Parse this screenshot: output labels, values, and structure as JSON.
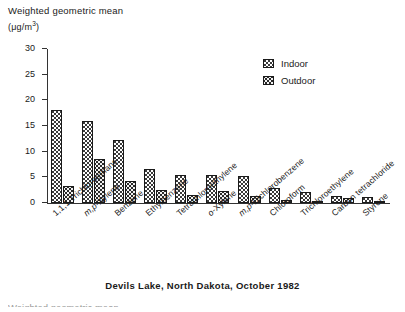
{
  "chart_data": {
    "type": "bar",
    "title": "",
    "caption": "Devils Lake, North Dakota, October 1982",
    "ylabel_line1": "Weighted geometric mean",
    "ylabel_line2": "(μg/m3)",
    "ylabel_unit_prefix": "(",
    "ylabel_unit_base": "μg/m",
    "ylabel_unit_sup": "3",
    "ylabel_unit_suffix": ")",
    "xlabel": "",
    "ylim": [
      0,
      30
    ],
    "yticks": [
      0,
      5,
      10,
      15,
      20,
      25,
      30
    ],
    "ytick_labels": [
      "0",
      "5",
      "10",
      "15",
      "20",
      "25",
      "30"
    ],
    "grid": false,
    "legend_position": "top-right",
    "categories": [
      "1,1,1 Trichloroethane",
      "m,p-Xylene",
      "Benzene",
      "Ethylbenzene",
      "Tetrachloroethylene",
      "o-Xylene",
      "m,p-Dichlorobenzene",
      "Chloroform",
      "Trichloroethylene",
      "Carbon tetrachloride",
      "Styrene"
    ],
    "series": [
      {
        "name": "Indoor",
        "values": [
          18.2,
          15.9,
          12.2,
          6.6,
          5.5,
          5.4,
          5.2,
          2.9,
          2.2,
          1.3,
          1.1
        ]
      },
      {
        "name": "Outdoor",
        "values": [
          3.4,
          8.5,
          4.3,
          2.6,
          1.5,
          2.4,
          1.3,
          0.5,
          0.4,
          1.0,
          0.4
        ]
      }
    ]
  },
  "legend": {
    "items": [
      {
        "label": "Indoor",
        "pattern": "dark-checker"
      },
      {
        "label": "Outdoor",
        "pattern": "light-dotted"
      }
    ]
  },
  "footer": {
    "partial_text": "Weighted geometric mean"
  }
}
